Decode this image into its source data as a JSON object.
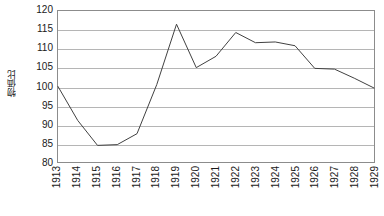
{
  "chart_data": {
    "type": "line",
    "title": "",
    "xlabel": "",
    "ylabel": "物価比",
    "categories": [
      "1913",
      "1914",
      "1915",
      "1916",
      "1917",
      "1918",
      "1919",
      "1920",
      "1921",
      "1922",
      "1923",
      "1924",
      "1925",
      "1926",
      "1927",
      "1928",
      "1929"
    ],
    "values": [
      100.0,
      91.0,
      84.4,
      84.6,
      87.5,
      100.5,
      116.5,
      105.0,
      108.0,
      114.3,
      111.6,
      111.8,
      110.8,
      104.8,
      104.6,
      102.2,
      99.6
    ],
    "series": [
      {
        "name": "物価比",
        "values": [
          100.0,
          91.0,
          84.4,
          84.6,
          87.5,
          100.5,
          116.5,
          105.0,
          108.0,
          114.3,
          111.6,
          111.8,
          110.8,
          104.8,
          104.6,
          102.2,
          99.6
        ]
      }
    ],
    "ylim": [
      80,
      120
    ],
    "ytick_labels": [
      "120",
      "115",
      "110",
      "105",
      "100",
      "95",
      "90",
      "85",
      "80"
    ],
    "ytick_values": [
      120,
      115,
      110,
      105,
      100,
      95,
      90,
      85,
      80
    ],
    "ystep": 5,
    "xlim_categories": [
      "1913",
      "1929"
    ],
    "grid": true,
    "grid_color": "#b5b5b5",
    "legend": "none",
    "line_color": "#404040",
    "line_width": 1,
    "markers": "none",
    "plot_border_color": "#8c8c8c",
    "background_color": "#ffffff"
  }
}
